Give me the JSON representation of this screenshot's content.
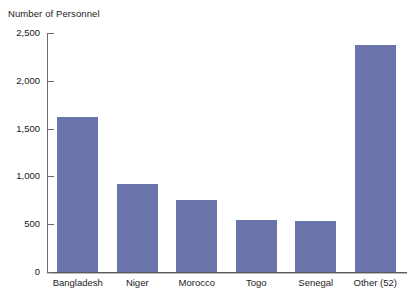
{
  "chart_data": {
    "type": "bar",
    "title": "Number of Personnel",
    "xlabel": "",
    "ylabel": "Number of Personnel",
    "categories": [
      "Bangladesh",
      "Niger",
      "Morocco",
      "Togo",
      "Senegal",
      "Other (52)"
    ],
    "values": [
      1620,
      920,
      755,
      545,
      535,
      2370
    ],
    "ylim": [
      0,
      2500
    ],
    "yticks": [
      0,
      500,
      1000,
      1500,
      2000,
      2500
    ],
    "ytick_labels": [
      "0",
      "500",
      "1,000",
      "1,500",
      "2,000",
      "2,500"
    ],
    "grid": false,
    "legend": null,
    "bar_color": "#6b74aa",
    "axis_color": "#6d6d6d",
    "background": "#ffffff"
  }
}
